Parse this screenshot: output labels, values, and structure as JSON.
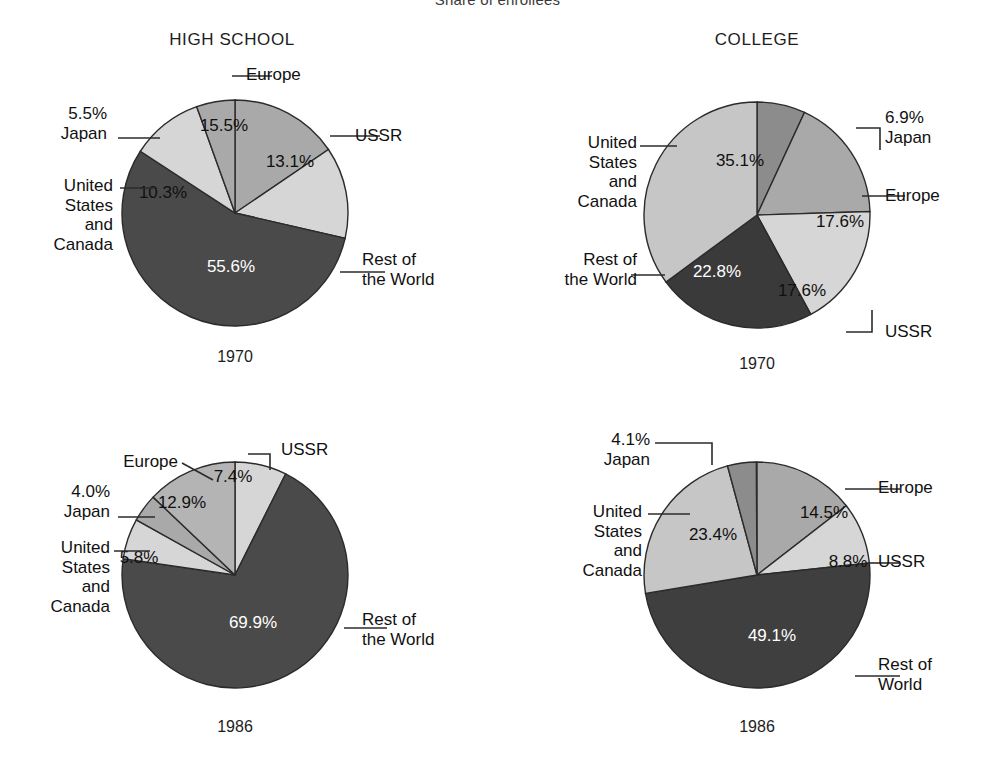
{
  "figure": {
    "supertitle": "Share of enrollees",
    "columns": [
      {
        "label": "HIGH SCHOOL",
        "x": 232
      },
      {
        "label": "COLLEGE",
        "x": 757
      }
    ]
  },
  "palette": {
    "rest_of_world": "#4a4a4a",
    "ussr": "#d6d6d6",
    "united_states_and_canada": "#d6d6d6",
    "europe": "#a9a9a9",
    "japan": "#8c8c8c",
    "outline": "#2b2b2b",
    "label_text": "#111111",
    "value_text_on_dark": "#ffffff",
    "background": "#ffffff"
  },
  "chart_data": [
    {
      "type": "pie",
      "title": "HIGH SCHOOL",
      "subtitle": "1970",
      "panel": "top-left",
      "start_angle_deg": 0,
      "direction": "clockwise",
      "categories": [
        "Europe",
        "USSR",
        "Rest of the World",
        "United States and Canada",
        "Japan"
      ],
      "values": [
        15.5,
        13.1,
        55.6,
        10.3,
        5.5
      ],
      "labels": [
        "15.5%",
        "13.1%",
        "55.6%",
        "10.3%",
        "5.5%"
      ],
      "colors": [
        "#a9a9a9",
        "#d6d6d6",
        "#4a4a4a",
        "#d6d6d6",
        "#a9a9a9"
      ],
      "callouts": [
        {
          "text": "Europe",
          "side": "right"
        },
        {
          "text": "USSR",
          "side": "right"
        },
        {
          "text": "Rest of\nthe World",
          "side": "right"
        },
        {
          "text": "United\nStates\nand\nCanada",
          "side": "left"
        },
        {
          "text": "5.5%\nJapan",
          "side": "left"
        }
      ]
    },
    {
      "type": "pie",
      "title": "COLLEGE",
      "subtitle": "1970",
      "panel": "top-right",
      "start_angle_deg": 0,
      "direction": "clockwise",
      "categories": [
        "Japan",
        "Europe",
        "USSR",
        "Rest of the World",
        "United States and Canada"
      ],
      "values": [
        6.9,
        17.6,
        17.6,
        22.8,
        35.1
      ],
      "labels": [
        "6.9%",
        "17.6%",
        "17.6%",
        "22.8%",
        "35.1%"
      ],
      "colors": [
        "#8c8c8c",
        "#a9a9a9",
        "#d6d6d6",
        "#3a3a3a",
        "#c6c6c6"
      ],
      "callouts": [
        {
          "text": "6.9%\nJapan",
          "side": "right"
        },
        {
          "text": "Europe",
          "side": "right"
        },
        {
          "text": "USSR",
          "side": "right"
        },
        {
          "text": "Rest of\nthe World",
          "side": "left"
        },
        {
          "text": "United\nStates\nand\nCanada",
          "side": "left"
        }
      ]
    },
    {
      "type": "pie",
      "title": "HIGH SCHOOL",
      "subtitle": "1986",
      "panel": "bottom-left",
      "start_angle_deg": 0,
      "direction": "clockwise",
      "categories": [
        "USSR",
        "Rest of the World",
        "United States and Canada",
        "Japan",
        "Europe"
      ],
      "values": [
        7.4,
        69.9,
        5.8,
        4.0,
        12.9
      ],
      "labels": [
        "7.4%",
        "69.9%",
        "5.8%",
        "4.0%",
        "12.9%"
      ],
      "colors": [
        "#d6d6d6",
        "#4a4a4a",
        "#d6d6d6",
        "#a9a9a9",
        "#b4b4b4"
      ],
      "callouts": [
        {
          "text": "USSR",
          "side": "right"
        },
        {
          "text": "Rest of\nthe World",
          "side": "right"
        },
        {
          "text": "United\nStates\nand\nCanada",
          "side": "left"
        },
        {
          "text": "4.0%\nJapan",
          "side": "left"
        },
        {
          "text": "Europe",
          "side": "left"
        }
      ]
    },
    {
      "type": "pie",
      "title": "COLLEGE",
      "subtitle": "1986",
      "panel": "bottom-right",
      "start_angle_deg": 0,
      "direction": "clockwise",
      "categories": [
        "Europe",
        "USSR",
        "Rest of the World",
        "United States and Canada",
        "Japan"
      ],
      "values": [
        14.5,
        8.8,
        49.1,
        23.4,
        4.1
      ],
      "labels": [
        "14.5%",
        "8.8%",
        "49.1%",
        "23.4%",
        "4.1%"
      ],
      "colors": [
        "#a9a9a9",
        "#d6d6d6",
        "#3f3f3f",
        "#c6c6c6",
        "#8c8c8c"
      ],
      "callouts": [
        {
          "text": "Europe",
          "side": "right"
        },
        {
          "text": "USSR",
          "side": "right"
        },
        {
          "text": "Rest of\nWorld",
          "side": "right"
        },
        {
          "text": "United\nStates\nand\nCanada",
          "side": "left"
        },
        {
          "text": "4.1%\nJapan",
          "side": "left"
        }
      ]
    }
  ],
  "panels": [
    {
      "id": "hs-1970",
      "cx": 235,
      "cy": 213,
      "r": 113,
      "year": "1970",
      "year_x": 235,
      "year_y": 348,
      "value_positions": [
        {
          "label": "15.5%",
          "x": 224,
          "y": 131,
          "light": false
        },
        {
          "label": "13.1%",
          "x": 290,
          "y": 167,
          "light": false
        },
        {
          "label": "55.6%",
          "x": 231,
          "y": 272,
          "light": true
        },
        {
          "label": "10.3%",
          "x": 163,
          "y": 198,
          "light": false
        }
      ],
      "callouts": [
        {
          "name": "europe",
          "text": "Europe",
          "x": 246,
          "y": 65,
          "align": "left",
          "line": "M 232,76 L 272,76"
        },
        {
          "name": "ussr",
          "text": "USSR",
          "x": 355,
          "y": 126,
          "align": "left",
          "line": "M 330,136 L 380,136"
        },
        {
          "name": "rest-of-the-world",
          "text": "Rest of\nthe World",
          "x": 362,
          "y": 250,
          "align": "left",
          "line": "M 340,272 L 385,272"
        },
        {
          "name": "united-states-and-canada",
          "text": "United\nStates\nand\nCanada",
          "x": 113,
          "y": 176,
          "align": "right",
          "line": "M 120,188 L 155,188"
        },
        {
          "name": "japan",
          "text": "5.5%\nJapan",
          "x": 107,
          "y": 104,
          "align": "right",
          "line": "M 118,138 L 160,138"
        }
      ]
    },
    {
      "id": "col-1970",
      "cx": 757,
      "cy": 215,
      "r": 113,
      "year": "1970",
      "year_x": 757,
      "year_y": 355,
      "value_positions": [
        {
          "label": "35.1%",
          "x": 740,
          "y": 166,
          "light": false
        },
        {
          "label": "17.6%",
          "x": 840,
          "y": 227,
          "light": false
        },
        {
          "label": "17.6%",
          "x": 802,
          "y": 296,
          "light": false
        },
        {
          "label": "22.8%",
          "x": 717,
          "y": 277,
          "light": true
        }
      ],
      "callouts": [
        {
          "name": "japan",
          "text": "6.9%\nJapan",
          "x": 885,
          "y": 108,
          "align": "left",
          "line": "M 856,128 L 880,128 L 880,150"
        },
        {
          "name": "europe",
          "text": "Europe",
          "x": 885,
          "y": 186,
          "align": "left",
          "line": "M 862,196 L 905,196"
        },
        {
          "name": "ussr",
          "text": "USSR",
          "x": 885,
          "y": 322,
          "align": "left",
          "line": "M 846,332 L 872,332 L 872,310"
        },
        {
          "name": "rest-of-the-world",
          "text": "Rest of\nthe World",
          "x": 637,
          "y": 250,
          "align": "right",
          "line": "M 631,275 L 665,275"
        },
        {
          "name": "united-states-and-canada",
          "text": "United\nStates\nand\nCanada",
          "x": 637,
          "y": 133,
          "align": "right",
          "line": "M 640,146 L 677,146"
        }
      ]
    },
    {
      "id": "hs-1986",
      "cx": 235,
      "cy": 575,
      "r": 113,
      "year": "1986",
      "year_x": 235,
      "year_y": 718,
      "value_positions": [
        {
          "label": "7.4%",
          "x": 233,
          "y": 482,
          "light": false
        },
        {
          "label": "12.9%",
          "x": 182,
          "y": 508,
          "light": false
        },
        {
          "label": "5.8%",
          "x": 139,
          "y": 563,
          "light": false
        },
        {
          "label": "69.9%",
          "x": 253,
          "y": 628,
          "light": true
        }
      ],
      "callouts": [
        {
          "name": "ussr",
          "text": "USSR",
          "x": 281,
          "y": 440,
          "align": "left",
          "line": "M 248,454 L 270,454 L 270,470"
        },
        {
          "name": "rest-of-the-world",
          "text": "Rest of\nthe World",
          "x": 362,
          "y": 610,
          "align": "left",
          "line": "M 344,628 L 387,628"
        },
        {
          "name": "united-states-and-canada",
          "text": "United\nStates\nand\nCanada",
          "x": 110,
          "y": 538,
          "align": "right",
          "line": "M 114,551 L 150,551"
        },
        {
          "name": "japan",
          "text": "4.0%\nJapan",
          "x": 110,
          "y": 482,
          "align": "right",
          "line": "M 118,517 L 155,517"
        },
        {
          "name": "europe",
          "text": "Europe",
          "x": 178,
          "y": 452,
          "align": "right",
          "line": "M 182,463 L 213,480"
        }
      ]
    },
    {
      "id": "col-1986",
      "cx": 757,
      "cy": 575,
      "r": 113,
      "year": "1986",
      "year_x": 757,
      "year_y": 718,
      "value_positions": [
        {
          "label": "14.5%",
          "x": 824,
          "y": 518,
          "light": false
        },
        {
          "label": "8.8%",
          "x": 848,
          "y": 567,
          "light": false
        },
        {
          "label": "49.1%",
          "x": 772,
          "y": 641,
          "light": true
        },
        {
          "label": "23.4%",
          "x": 713,
          "y": 540,
          "light": false
        }
      ],
      "callouts": [
        {
          "name": "europe",
          "text": "Europe",
          "x": 878,
          "y": 478,
          "align": "left",
          "line": "M 845,489 L 900,489"
        },
        {
          "name": "ussr",
          "text": "USSR",
          "x": 878,
          "y": 552,
          "align": "left",
          "line": "M 868,563 L 900,563"
        },
        {
          "name": "rest-of-world",
          "text": "Rest of\nWorld",
          "x": 878,
          "y": 655,
          "align": "left",
          "line": "M 855,676 L 900,676"
        },
        {
          "name": "united-states-and-canada",
          "text": "United\nStates\nand\nCanada",
          "x": 642,
          "y": 502,
          "align": "right",
          "line": "M 648,514 L 690,514"
        },
        {
          "name": "japan",
          "text": "4.1%\nJapan",
          "x": 650,
          "y": 430,
          "align": "right",
          "line": "M 655,443 L 712,443 L 712,465"
        }
      ]
    }
  ]
}
